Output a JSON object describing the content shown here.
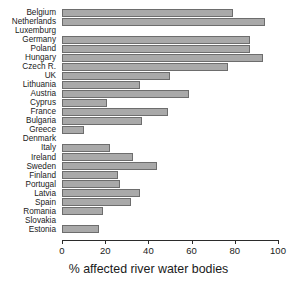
{
  "chart_data": {
    "type": "bar",
    "orientation": "horizontal",
    "title": "",
    "xlabel": "% affected river water bodies",
    "ylabel": "",
    "xlim": [
      0,
      100
    ],
    "xticks": [
      0,
      20,
      40,
      60,
      80,
      100
    ],
    "grid": false,
    "legend": null,
    "bar_color": "#a9a9a9",
    "bar_edge_color": "#6d6d6d",
    "categories": [
      "Belgium",
      "Netherlands",
      "Luxemburg",
      "Germany",
      "Poland",
      "Hungary",
      "Czech R.",
      "UK",
      "Lithuania",
      "Austria",
      "Cyprus",
      "France",
      "Bulgaria",
      "Greece",
      "Denmark",
      "Italy",
      "Ireland",
      "Sweden",
      "Finland",
      "Portugal",
      "Latvia",
      "Spain",
      "Romania",
      "Slovakia",
      "Estonia"
    ],
    "values": [
      79,
      94,
      null,
      87,
      87,
      93,
      77,
      50,
      36,
      59,
      21,
      49,
      37,
      10,
      null,
      22,
      33,
      44,
      26,
      27,
      36,
      32,
      19,
      null,
      17
    ]
  }
}
